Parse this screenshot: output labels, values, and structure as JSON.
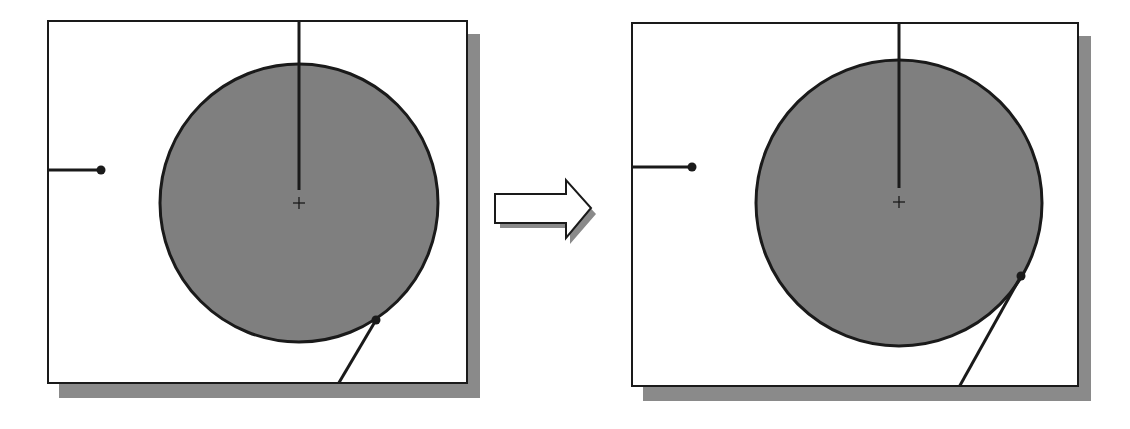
{
  "diagram": {
    "colors": {
      "circle_fill": "#7f7f7f",
      "stroke": "#1a1a1a",
      "shadow": "#8a8a8a",
      "background": "#ffffff"
    },
    "panels": [
      {
        "name": "before",
        "box": {
          "x": 47,
          "y": 20,
          "w": 421,
          "h": 364
        },
        "circle": {
          "cx": 299,
          "cy": 203,
          "r": 140
        },
        "vertical_line": {
          "x": 299,
          "y1": 20,
          "y2": 190
        },
        "center_mark": "+",
        "left_segment": {
          "x1": 47,
          "y1": 170,
          "x2": 101,
          "y2": 170
        },
        "tangent_point": {
          "x": 376,
          "y": 320
        },
        "tangent_line_end": {
          "x": 337,
          "y": 384
        }
      },
      {
        "name": "after",
        "box": {
          "x": 631,
          "y": 22,
          "w": 448,
          "h": 365
        },
        "circle": {
          "cx": 899,
          "cy": 203,
          "r": 144
        },
        "vertical_line": {
          "x": 899,
          "y1": 22,
          "y2": 188
        },
        "center_mark": "+",
        "left_segment": {
          "x1": 631,
          "y1": 167,
          "x2": 692,
          "y2": 167
        },
        "tangent_point": {
          "x": 1021,
          "y": 276
        },
        "tangent_line_end": {
          "x": 958,
          "y": 387
        }
      }
    ],
    "arrow": {
      "direction": "right",
      "icon": "right-arrow-icon"
    }
  }
}
